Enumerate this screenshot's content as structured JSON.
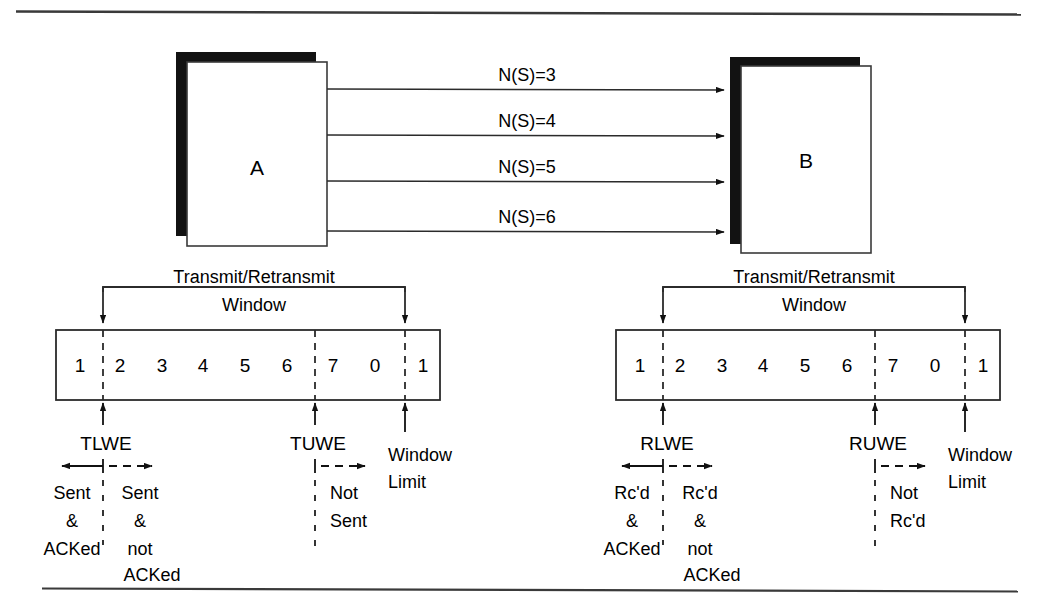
{
  "figure": {
    "rules": {
      "top_y": 11,
      "bottom_y": 588,
      "x_start": 16,
      "x_end": 1021
    }
  },
  "nodes": {
    "sender": {
      "label": "A"
    },
    "receiver": {
      "label": "B"
    }
  },
  "frames": [
    {
      "label": "N(S)=3"
    },
    {
      "label": "N(S)=4"
    },
    {
      "label": "N(S)=5"
    },
    {
      "label": "N(S)=6"
    }
  ],
  "panels": [
    {
      "id": "transmit",
      "bracket_title_line1": "Transmit/Retransmit",
      "bracket_title_line2": "Window",
      "cells": [
        "1",
        "2",
        "3",
        "4",
        "5",
        "6",
        "7",
        "0",
        "1"
      ],
      "markers": [
        {
          "name": "lower-window-edge",
          "label": "TLWE"
        },
        {
          "name": "upper-window-edge",
          "label": "TUWE"
        },
        {
          "name": "window-limit",
          "label_line1": "Window",
          "label_line2": "Limit"
        }
      ],
      "regions": [
        {
          "name": "acked",
          "lines": [
            "Sent",
            "&",
            "ACKed"
          ]
        },
        {
          "name": "not-acked",
          "lines": [
            "Sent",
            "&",
            "not",
            "ACKed"
          ]
        },
        {
          "name": "not-sent",
          "lines": [
            "Not",
            "Sent"
          ]
        }
      ]
    },
    {
      "id": "receive",
      "bracket_title_line1": "Transmit/Retransmit",
      "bracket_title_line2": "Window",
      "cells": [
        "1",
        "2",
        "3",
        "4",
        "5",
        "6",
        "7",
        "0",
        "1"
      ],
      "markers": [
        {
          "name": "lower-window-edge",
          "label": "RLWE"
        },
        {
          "name": "upper-window-edge",
          "label": "RUWE"
        },
        {
          "name": "window-limit",
          "label_line1": "Window",
          "label_line2": "Limit"
        }
      ],
      "regions": [
        {
          "name": "acked",
          "lines": [
            "Rc'd",
            "&",
            "ACKed"
          ]
        },
        {
          "name": "not-acked",
          "lines": [
            "Rc'd",
            "&",
            "not",
            "ACKed"
          ]
        },
        {
          "name": "not-rcd",
          "lines": [
            "Not",
            "Rc'd"
          ]
        }
      ]
    }
  ],
  "colors": {
    "ink": "#000000",
    "line": "#2b2b2b",
    "shadow": "#111111",
    "paper": "#ffffff"
  }
}
